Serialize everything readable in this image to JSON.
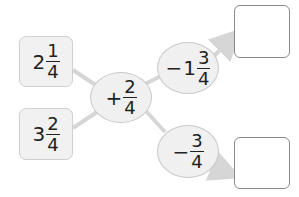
{
  "inputs": [
    {
      "whole": "2",
      "numerator": "1",
      "denominator": "4"
    },
    {
      "whole": "3",
      "numerator": "2",
      "denominator": "4"
    }
  ],
  "operation": {
    "sign": "+",
    "whole": "",
    "numerator": "2",
    "denominator": "4"
  },
  "branches": [
    {
      "sign": "−",
      "whole": "1",
      "numerator": "3",
      "denominator": "4",
      "answer": ""
    },
    {
      "sign": "−",
      "whole": "",
      "numerator": "3",
      "denominator": "4",
      "answer": ""
    }
  ],
  "colors": {
    "line": "#d6d6d6",
    "box_fill": "#f1f1f1",
    "answer_border": "#8a8a8a"
  }
}
